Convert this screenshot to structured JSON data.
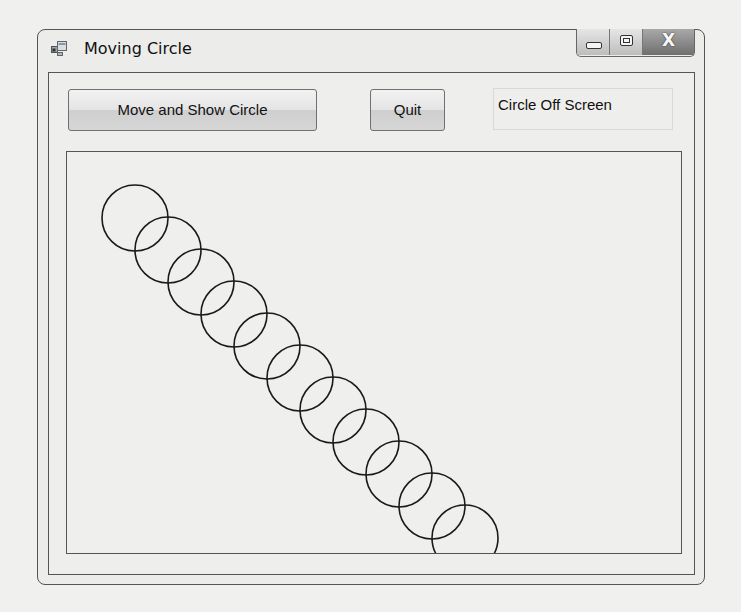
{
  "window": {
    "title": "Moving Circle",
    "icon": "app-window-icon",
    "caption_buttons": [
      {
        "name": "minimize-button",
        "icon": "minimize-icon",
        "glyph": ""
      },
      {
        "name": "maximize-button",
        "icon": "maximize-icon",
        "glyph": ""
      },
      {
        "name": "close-button",
        "icon": "close-icon",
        "glyph": "X"
      }
    ]
  },
  "toolbar": {
    "move_button_label": "Move and Show Circle",
    "quit_button_label": "Quit",
    "status_text": "Circle Off Screen"
  },
  "canvas": {
    "stroke_color": "#1a1a1a",
    "radius": 33,
    "circles": [
      {
        "cx": 68,
        "cy": 66
      },
      {
        "cx": 101,
        "cy": 98
      },
      {
        "cx": 134,
        "cy": 130
      },
      {
        "cx": 167,
        "cy": 162
      },
      {
        "cx": 200,
        "cy": 194
      },
      {
        "cx": 233,
        "cy": 226
      },
      {
        "cx": 266,
        "cy": 258
      },
      {
        "cx": 299,
        "cy": 290
      },
      {
        "cx": 332,
        "cy": 322
      },
      {
        "cx": 365,
        "cy": 354
      },
      {
        "cx": 398,
        "cy": 386
      }
    ]
  }
}
